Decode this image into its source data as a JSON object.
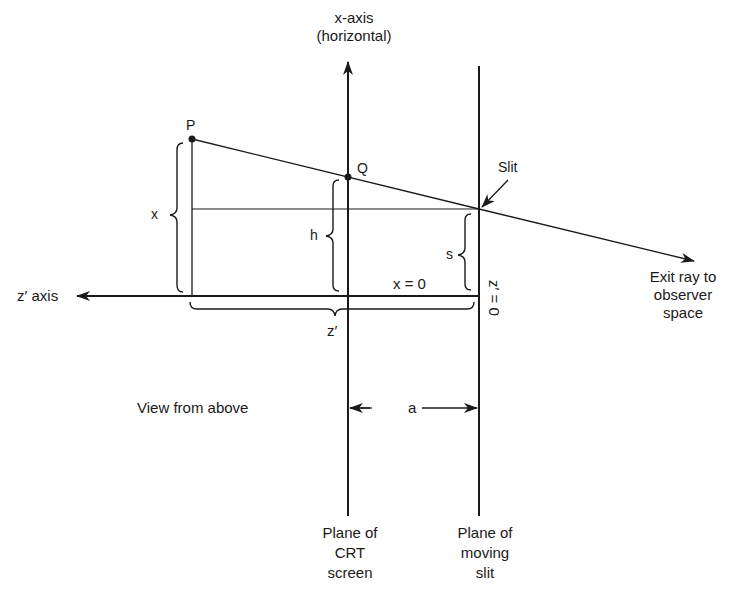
{
  "diagram": {
    "title": "View from above",
    "axes": {
      "x_axis_label": "x-axis\n(horizontal)",
      "z_axis_label": "z′ axis",
      "x_zero_label": "x = 0",
      "z_zero_label": "z′ = 0"
    },
    "points": {
      "P": "P",
      "Q": "Q",
      "slit": "Slit"
    },
    "dimensions": {
      "x": "x",
      "h": "h",
      "s": "s",
      "z_prime": "z′",
      "a": "a"
    },
    "annotations": {
      "exit_ray": "Exit ray to\nobserver\nspace",
      "crt_plane": "Plane of\nCRT\nscreen",
      "slit_plane": "Plane of\nmoving\nslit"
    },
    "colors": {
      "ink": "#1a1a1a",
      "background": "#ffffff"
    }
  }
}
